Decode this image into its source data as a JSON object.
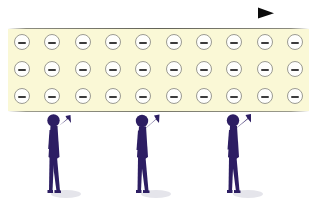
{
  "figure": {
    "width": 317,
    "height": 203,
    "background_color": "#ffffff"
  },
  "arrow": {
    "name": "current-direction-arrow",
    "direction": "right",
    "color": "#111111",
    "x_start": 42,
    "x_end": 272,
    "y": 13,
    "line_width": 2,
    "head_length": 14,
    "head_width": 11
  },
  "conductor": {
    "name": "conductor-band",
    "fill_color": "#faf8d6",
    "edge_color": "#5a5a4e",
    "x": 8,
    "y": 29,
    "width": 301,
    "height": 82
  },
  "electrons": {
    "name": "electron-grid",
    "symbol": "minus",
    "rows": 3,
    "columns": 10,
    "total": 30,
    "circle_fill": "#fefefc",
    "circle_stroke": "#9c9c92",
    "bar_color": "#3b3b3b",
    "diameter": 16,
    "row_y": [
      34,
      61,
      88
    ],
    "grid": [
      [
        "-",
        "-",
        "-",
        "-",
        "-",
        "-",
        "-",
        "-",
        "-",
        "-"
      ],
      [
        "-",
        "-",
        "-",
        "-",
        "-",
        "-",
        "-",
        "-",
        "-",
        "-"
      ],
      [
        "-",
        "-",
        "-",
        "-",
        "-",
        "-",
        "-",
        "-",
        "-",
        "-"
      ]
    ]
  },
  "people": {
    "name": "observer-figures",
    "count": 3,
    "body_color": "#2d1e63",
    "shadow_color": "#d9d9e2",
    "pose": "standing-with-raised-arm",
    "items": [
      {
        "id": "person-left",
        "label": "observer-1",
        "x": 40,
        "arm": "raised-right"
      },
      {
        "id": "person-middle",
        "label": "observer-2",
        "x": 128,
        "arm": "raised-right"
      },
      {
        "id": "person-right",
        "label": "observer-3",
        "x": 218,
        "arm": "raised-right"
      }
    ]
  }
}
